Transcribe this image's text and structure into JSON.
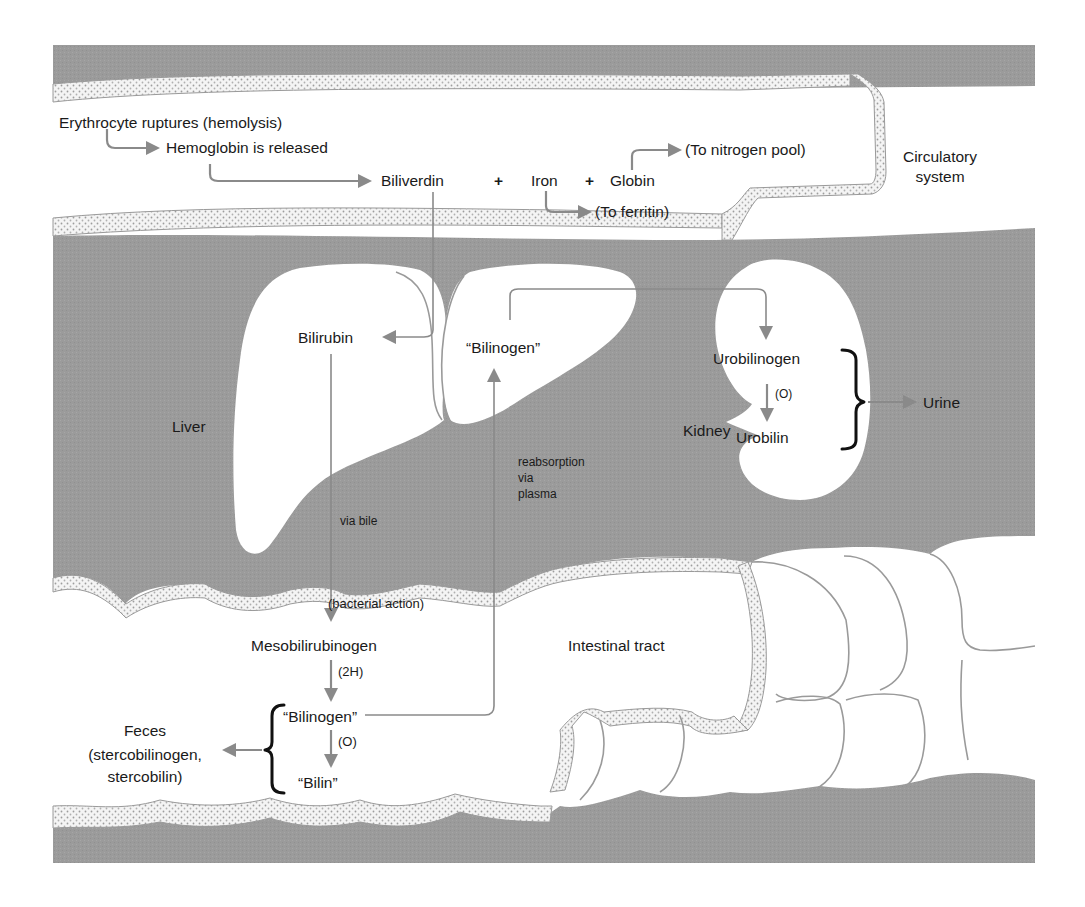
{
  "figure": {
    "colors": {
      "tissue_gray": "#9b9b9b",
      "organ_white": "#ffffff",
      "arrow_gray": "#8a8a8a",
      "wall_stipple": "#c9c9c9",
      "text": "#1a1a1a"
    }
  },
  "regions": {
    "circulatory": "Circulatory",
    "circulatory_line2": "system",
    "liver": "Liver",
    "kidney": "Kidney",
    "intestine": "Intestinal tract"
  },
  "nodes": {
    "erythrocyte": "Erythrocyte ruptures (hemolysis)",
    "hemoglobin": "Hemoglobin is released",
    "biliverdin": "Biliverdin",
    "plus1": "+",
    "iron": "Iron",
    "plus2": "+",
    "globin": "Globin",
    "to_nitrogen": "(To nitrogen pool)",
    "to_ferritin": "(To ferritin)",
    "bilirubin": "Bilirubin",
    "bilinogen_liver": "“Bilinogen”",
    "urobilinogen": "Urobilinogen",
    "urobilin": "Urobilin",
    "urine": "Urine",
    "mesobilirubinogen": "Mesobilirubinogen",
    "bilinogen_intestine": "“Bilinogen”",
    "bilin": "“Bilin”",
    "feces": "Feces",
    "feces_detail1": "(stercobilinogen,",
    "feces_detail2": "stercobilin)"
  },
  "edge_labels": {
    "via_bile": "via bile",
    "bacterial_action": "(bacterial action)",
    "two_h": "(2H)",
    "oxidation_intestine": "(O)",
    "oxidation_kidney": "(O)",
    "reabsorption1": "reabsorption",
    "reabsorption2": "via",
    "reabsorption3": "plasma"
  },
  "edges": [
    {
      "from": "erythrocyte",
      "to": "hemoglobin"
    },
    {
      "from": "hemoglobin",
      "to": "biliverdin"
    },
    {
      "from": "globin",
      "to": "to_nitrogen"
    },
    {
      "from": "iron",
      "to": "to_ferritin"
    },
    {
      "from": "biliverdin",
      "to": "bilirubin"
    },
    {
      "from": "bilirubin",
      "to": "mesobilirubinogen",
      "label": "via bile / (bacterial action)"
    },
    {
      "from": "mesobilirubinogen",
      "to": "bilinogen_intestine",
      "label": "(2H)"
    },
    {
      "from": "bilinogen_intestine",
      "to": "bilin",
      "label": "(O)"
    },
    {
      "from": "bilinogen_intestine",
      "to": "bilinogen_liver",
      "label": "reabsorption via plasma"
    },
    {
      "from": "bilinogen_liver",
      "to": "urobilinogen"
    },
    {
      "from": "urobilinogen",
      "to": "urobilin",
      "label": "(O)"
    },
    {
      "from": "kidney_products",
      "to": "urine"
    },
    {
      "from": "intestine_products",
      "to": "feces"
    }
  ]
}
